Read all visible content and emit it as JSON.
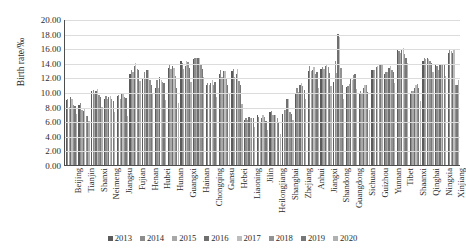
{
  "chart_data": {
    "type": "bar",
    "title": "",
    "xlabel": "",
    "ylabel": "Birth rate/‰",
    "ylim": [
      0,
      20
    ],
    "ytick_step": 2,
    "ytick_labels": [
      "20.00",
      "18.00",
      "16.00",
      "14.00",
      "12.00",
      "10.00",
      "8.00",
      "6.00",
      "4.00",
      "2.00",
      "0.00"
    ],
    "grid": "horizontal",
    "legend_position": "bottom",
    "series_colors": [
      "#5b5b5b",
      "#8c8c8c",
      "#a8a8a8",
      "#6f6f6f",
      "#bdbdbd",
      "#929292",
      "#777777",
      "#b0b0b0"
    ],
    "categories": [
      "Beijing",
      "Tianjin",
      "Shanxi",
      "Neimeng",
      "Jiangsu",
      "Fujian",
      "Henan",
      "Hubei",
      "Hunan",
      "Guangxi",
      "Hainan",
      "Chongqing",
      "Gansu",
      "Hebei",
      "Liaoning",
      "Jilin",
      "Heilongjiang",
      "Shanghai",
      "Zhejiang",
      "Anhui",
      "Jiangxi",
      "Shandong",
      "Guangdong",
      "Sichuan",
      "Guizhou",
      "Yunnan",
      "Tibet",
      "Shaanxi",
      "Qinghai",
      "Ningxia",
      "Xinjiang"
    ],
    "series": [
      {
        "name": "2013",
        "values": [
          8.93,
          8.2,
          10.1,
          9.1,
          9.47,
          12.5,
          11.92,
          10.6,
          13.28,
          14.26,
          14.57,
          11.0,
          12.5,
          12.92,
          6.15,
          6.8,
          7.2,
          7.0,
          9.8,
          12.9,
          13.1,
          11.41,
          10.71,
          9.9,
          13.05,
          12.4,
          15.8,
          9.9,
          14.2,
          13.7,
          15.34
        ]
      },
      {
        "name": "2014",
        "values": [
          9.1,
          8.5,
          10.3,
          9.4,
          9.6,
          13.0,
          12.8,
          11.7,
          13.7,
          14.0,
          14.6,
          11.2,
          13.0,
          13.2,
          6.4,
          6.6,
          7.4,
          7.5,
          10.5,
          13.5,
          13.4,
          14.23,
          10.8,
          10.2,
          13.0,
          12.8,
          15.6,
          10.1,
          14.6,
          13.6,
          15.9
        ]
      },
      {
        "name": "2015",
        "values": [
          7.96,
          7.6,
          9.9,
          9.1,
          9.05,
          12.8,
          11.8,
          10.6,
          13.1,
          13.1,
          14.6,
          11.0,
          12.1,
          12.1,
          6.17,
          5.9,
          6.8,
          7.52,
          10.0,
          12.9,
          13.2,
          12.55,
          11.12,
          9.7,
          13.0,
          12.7,
          15.4,
          10.1,
          14.5,
          13.0,
          15.6
        ]
      },
      {
        "name": "2016",
        "values": [
          9.32,
          7.4,
          10.2,
          9.3,
          9.76,
          13.6,
          12.96,
          12.0,
          13.6,
          13.6,
          14.6,
          11.3,
          12.9,
          12.4,
          6.6,
          6.5,
          6.9,
          9.0,
          11.0,
          13.0,
          13.5,
          17.89,
          11.85,
          10.5,
          13.4,
          13.3,
          15.8,
          10.6,
          14.7,
          13.7,
          15.3
        ]
      },
      {
        "name": "2017",
        "values": [
          9.06,
          7.7,
          10.4,
          9.5,
          9.7,
          14.0,
          12.95,
          11.6,
          13.3,
          14.2,
          14.6,
          11.7,
          12.9,
          13.2,
          6.49,
          6.8,
          6.8,
          9.1,
          11.2,
          13.4,
          13.8,
          17.54,
          11.7,
          11.0,
          13.6,
          13.5,
          16.0,
          11.0,
          14.5,
          13.7,
          15.88
        ]
      },
      {
        "name": "2018",
        "values": [
          8.24,
          6.7,
          9.6,
          9.0,
          9.32,
          13.2,
          11.7,
          11.4,
          12.2,
          14.1,
          13.9,
          11.0,
          11.9,
          11.5,
          6.39,
          6.6,
          6.5,
          7.2,
          10.8,
          12.4,
          13.4,
          13.26,
          12.3,
          11.0,
          13.9,
          13.0,
          15.2,
          11.1,
          14.3,
          13.7,
          10.9
        ]
      },
      {
        "name": "2019",
        "values": [
          8.12,
          6.7,
          9.3,
          8.8,
          9.12,
          13.0,
          11.0,
          11.3,
          10.6,
          13.3,
          13.1,
          11.4,
          11.0,
          10.9,
          6.45,
          6.0,
          5.7,
          7.0,
          10.3,
          12.7,
          12.6,
          11.0,
          12.5,
          10.0,
          13.7,
          12.7,
          14.6,
          10.5,
          14.0,
          13.7,
          11.0
        ]
      },
      {
        "name": "2020",
        "values": [
          6.98,
          5.99,
          8.0,
          7.2,
          6.66,
          11.5,
          9.7,
          8.9,
          8.53,
          11.4,
          12.0,
          9.3,
          9.9,
          8.3,
          5.17,
          4.8,
          4.2,
          6.2,
          9.0,
          10.5,
          10.8,
          9.0,
          10.4,
          7.6,
          13.7,
          11.3,
          14.0,
          8.8,
          12.7,
          12.2,
          11.7
        ]
      }
    ]
  },
  "legend": {
    "items": [
      {
        "label": "2013"
      },
      {
        "label": "2014"
      },
      {
        "label": "2015"
      },
      {
        "label": "2016"
      },
      {
        "label": "2017"
      },
      {
        "label": "2018"
      },
      {
        "label": "2019"
      },
      {
        "label": "2020"
      }
    ]
  }
}
